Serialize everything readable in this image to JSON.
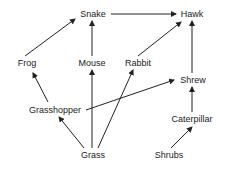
{
  "nodes": [
    {
      "id": "snake",
      "label": "Snake",
      "x": 93,
      "y": 14
    },
    {
      "id": "hawk",
      "label": "Hawk",
      "x": 192,
      "y": 14
    },
    {
      "id": "frog",
      "label": "Frog",
      "x": 27,
      "y": 63
    },
    {
      "id": "mouse",
      "label": "Mouse",
      "x": 92,
      "y": 63
    },
    {
      "id": "rabbit",
      "label": "Rabbit",
      "x": 138,
      "y": 63
    },
    {
      "id": "shrew",
      "label": "Shrew",
      "x": 193,
      "y": 80
    },
    {
      "id": "grasshopper",
      "label": "Grasshopper",
      "x": 55,
      "y": 110
    },
    {
      "id": "caterpillar",
      "label": "Caterpillar",
      "x": 192,
      "y": 119
    },
    {
      "id": "grass",
      "label": "Grass",
      "x": 93,
      "y": 155
    },
    {
      "id": "shrubs",
      "label": "Shrubs",
      "x": 169,
      "y": 155
    }
  ],
  "edges": [
    {
      "from": "snake",
      "to": "hawk",
      "x1": 111,
      "y1": 14,
      "x2": 176,
      "y2": 14
    },
    {
      "from": "frog",
      "to": "snake",
      "x1": 25,
      "y1": 56,
      "x2": 75,
      "y2": 19
    },
    {
      "from": "mouse",
      "to": "snake",
      "x1": 92,
      "y1": 56,
      "x2": 92,
      "y2": 21
    },
    {
      "from": "rabbit",
      "to": "hawk",
      "x1": 138,
      "y1": 56,
      "x2": 181,
      "y2": 22
    },
    {
      "from": "shrew",
      "to": "hawk",
      "x1": 192,
      "y1": 73,
      "x2": 192,
      "y2": 21
    },
    {
      "from": "grasshopper",
      "to": "frog",
      "x1": 48,
      "y1": 102,
      "x2": 33,
      "y2": 73
    },
    {
      "from": "grasshopper",
      "to": "shrew",
      "x1": 86,
      "y1": 110,
      "x2": 174,
      "y2": 80
    },
    {
      "from": "grass",
      "to": "grasshopper",
      "x1": 84,
      "y1": 148,
      "x2": 59,
      "y2": 117
    },
    {
      "from": "grass",
      "to": "mouse",
      "x1": 92,
      "y1": 148,
      "x2": 92,
      "y2": 70
    },
    {
      "from": "grass",
      "to": "rabbit",
      "x1": 98,
      "y1": 148,
      "x2": 133,
      "y2": 70
    },
    {
      "from": "caterpillar",
      "to": "shrew",
      "x1": 192,
      "y1": 112,
      "x2": 192,
      "y2": 87
    },
    {
      "from": "shrubs",
      "to": "caterpillar",
      "x1": 171,
      "y1": 148,
      "x2": 192,
      "y2": 127
    }
  ]
}
